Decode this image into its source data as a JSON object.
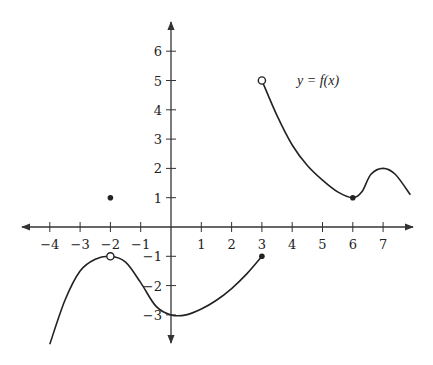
{
  "chart_data": {
    "type": "line",
    "title": "",
    "function_label": "y = f(x)",
    "xlabel": "",
    "ylabel": "",
    "xlim": [
      -4.8,
      7.9
    ],
    "ylim": [
      -3.9,
      7.0
    ],
    "grid": false,
    "x_ticks": [
      -4,
      -3,
      -2,
      -1,
      1,
      2,
      3,
      4,
      5,
      6,
      7
    ],
    "y_ticks": [
      -3,
      -2,
      -1,
      1,
      2,
      3,
      4,
      5,
      6
    ],
    "x_tick_labels": [
      "−4",
      "−3",
      "−2",
      "−1",
      "1",
      "2",
      "3",
      "4",
      "5",
      "6",
      "7"
    ],
    "y_tick_labels": [
      "−3",
      "−2",
      "−1",
      "1",
      "2",
      "3",
      "4",
      "5",
      "6"
    ],
    "series": [
      {
        "name": "piece-1",
        "domain": [
          -4,
          3
        ],
        "points": [
          [
            -4,
            -4
          ],
          [
            -3.5,
            -2.5
          ],
          [
            -3,
            -1.5
          ],
          [
            -2.5,
            -1.1
          ],
          [
            -2,
            -1
          ],
          [
            -1.5,
            -1.2
          ],
          [
            -1,
            -1.9
          ],
          [
            -0.5,
            -2.7
          ],
          [
            0,
            -3
          ],
          [
            0.5,
            -3.0
          ],
          [
            1,
            -2.8
          ],
          [
            1.5,
            -2.5
          ],
          [
            2,
            -2.1
          ],
          [
            2.5,
            -1.6
          ],
          [
            3,
            -1
          ]
        ],
        "open_points": [
          [
            -2,
            -1
          ]
        ],
        "closed_points": [
          [
            3,
            -1
          ]
        ]
      },
      {
        "name": "piece-2",
        "domain": [
          3,
          7.9
        ],
        "points": [
          [
            3,
            5
          ],
          [
            3.5,
            3.8
          ],
          [
            4,
            2.8
          ],
          [
            4.5,
            2.1
          ],
          [
            5,
            1.6
          ],
          [
            5.5,
            1.2
          ],
          [
            6,
            1
          ],
          [
            6.3,
            1.2
          ],
          [
            6.6,
            1.8
          ],
          [
            7,
            2
          ],
          [
            7.4,
            1.8
          ],
          [
            7.9,
            1.1
          ]
        ],
        "open_points": [
          [
            3,
            5
          ]
        ],
        "closed_points": [
          [
            6,
            1
          ]
        ]
      }
    ],
    "isolated_points": [
      [
        -2,
        1
      ]
    ],
    "annotations": [
      {
        "text": "y = f(x)",
        "x": 4.2,
        "y": 5
      }
    ]
  }
}
